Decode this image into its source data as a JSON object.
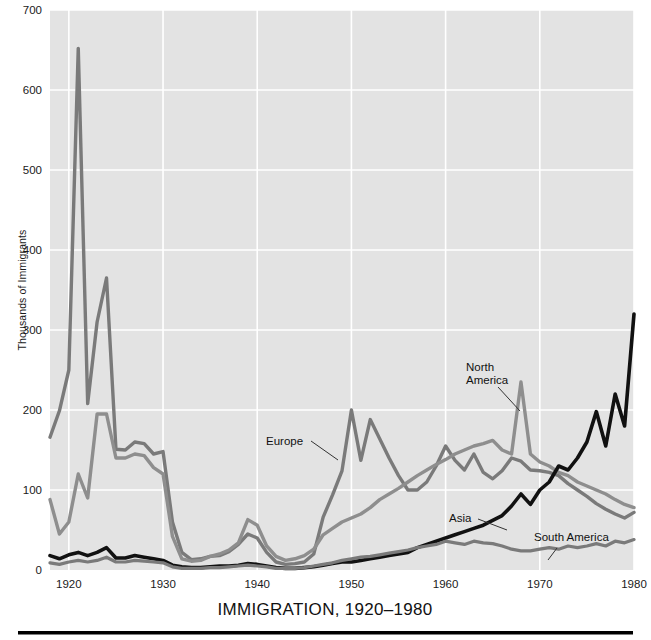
{
  "chart_data": {
    "type": "line",
    "title": "IMMIGRATION, 1920–1980",
    "xlabel": "",
    "ylabel": "Thousands of Immigrants",
    "xlim": [
      1918,
      1980
    ],
    "ylim": [
      0,
      700
    ],
    "grid": true,
    "legend_position": "inline-annotations",
    "background_color": "#e3e3e3",
    "page_background_color": "#ffffff",
    "x_ticks": [
      1920,
      1930,
      1940,
      1950,
      1960,
      1970,
      1980
    ],
    "x_tick_labels": [
      "1920",
      "1930",
      "1940",
      "1950",
      "1960",
      "1970",
      "1980"
    ],
    "y_ticks": [
      0,
      100,
      200,
      300,
      400,
      500,
      600,
      700
    ],
    "y_tick_labels": [
      "0",
      "100",
      "200",
      "300",
      "400",
      "500",
      "600",
      "700"
    ],
    "x": [
      1918,
      1919,
      1920,
      1921,
      1922,
      1923,
      1924,
      1925,
      1926,
      1927,
      1928,
      1929,
      1930,
      1931,
      1932,
      1933,
      1934,
      1935,
      1936,
      1937,
      1938,
      1939,
      1940,
      1941,
      1942,
      1943,
      1944,
      1945,
      1946,
      1947,
      1948,
      1949,
      1950,
      1951,
      1952,
      1953,
      1954,
      1955,
      1956,
      1957,
      1958,
      1959,
      1960,
      1961,
      1962,
      1963,
      1964,
      1965,
      1966,
      1967,
      1968,
      1969,
      1970,
      1971,
      1972,
      1973,
      1974,
      1975,
      1976,
      1977,
      1978,
      1979,
      1980
    ],
    "series": [
      {
        "name": "Europe",
        "color": "#7a7a7a",
        "line_width": 3.4,
        "label_x": 1945,
        "label_y": 163,
        "values": [
          166,
          199,
          250,
          652,
          208,
          310,
          365,
          151,
          150,
          160,
          158,
          145,
          148,
          60,
          22,
          13,
          14,
          17,
          18,
          23,
          32,
          45,
          40,
          22,
          10,
          7,
          8,
          10,
          20,
          66,
          94,
          124,
          200,
          137,
          188,
          164,
          140,
          118,
          100,
          100,
          110,
          130,
          155,
          137,
          125,
          145,
          122,
          114,
          124,
          140,
          136,
          125,
          124,
          122,
          118,
          108,
          100,
          92,
          83,
          76,
          70,
          65,
          72
        ]
      },
      {
        "name": "North America",
        "color": "#8e8e8e",
        "line_width": 3.4,
        "label_x": 1959,
        "label_y": 390,
        "values": [
          88,
          45,
          60,
          120,
          90,
          195,
          195,
          140,
          140,
          145,
          143,
          128,
          120,
          42,
          14,
          11,
          12,
          17,
          20,
          25,
          34,
          63,
          56,
          30,
          17,
          12,
          14,
          18,
          26,
          44,
          52,
          60,
          65,
          70,
          78,
          88,
          95,
          102,
          110,
          118,
          125,
          132,
          138,
          145,
          150,
          155,
          158,
          162,
          150,
          145,
          235,
          145,
          135,
          130,
          122,
          118,
          110,
          105,
          100,
          95,
          88,
          82,
          78
        ]
      },
      {
        "name": "Asia",
        "color": "#111111",
        "line_width": 3.6,
        "label_x": 1958,
        "label_y": 64,
        "values": [
          18,
          14,
          19,
          22,
          18,
          22,
          28,
          15,
          15,
          18,
          16,
          14,
          12,
          6,
          4,
          3,
          3,
          4,
          5,
          5,
          6,
          8,
          7,
          5,
          3,
          2,
          2,
          3,
          4,
          6,
          8,
          10,
          10,
          12,
          14,
          16,
          18,
          20,
          22,
          28,
          32,
          36,
          40,
          44,
          48,
          52,
          56,
          62,
          68,
          80,
          95,
          82,
          100,
          110,
          130,
          125,
          140,
          160,
          198,
          155,
          220,
          180,
          320
        ]
      },
      {
        "name": "South America",
        "color": "#7a7a7a",
        "line_width": 3.2,
        "label_x": 1967,
        "label_y": 46,
        "values": [
          9,
          7,
          10,
          12,
          10,
          12,
          16,
          10,
          10,
          12,
          11,
          10,
          9,
          4,
          2,
          2,
          2,
          3,
          3,
          4,
          5,
          6,
          5,
          4,
          2,
          2,
          2,
          3,
          5,
          7,
          9,
          12,
          14,
          16,
          17,
          19,
          21,
          23,
          25,
          28,
          30,
          32,
          36,
          34,
          32,
          36,
          34,
          33,
          30,
          26,
          24,
          24,
          26,
          28,
          26,
          30,
          28,
          30,
          33,
          30,
          36,
          34,
          38
        ]
      }
    ],
    "annotations": [
      {
        "text": "Europe",
        "series": "Europe"
      },
      {
        "text": "North",
        "series": "North America"
      },
      {
        "text": "America",
        "series": "North America"
      },
      {
        "text": "Asia",
        "series": "Asia"
      },
      {
        "text": "South America",
        "series": "South America"
      }
    ]
  }
}
